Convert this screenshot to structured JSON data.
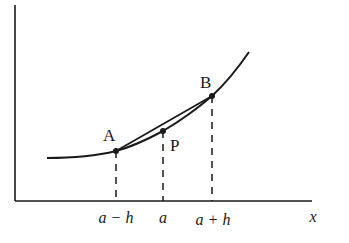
{
  "diagram": {
    "type": "central-difference-secant",
    "colors": {
      "ink": "#1a1a1a",
      "background": "#ffffff"
    },
    "axes": {
      "x_label": "x",
      "y_label": ""
    },
    "points": [
      {
        "id": "A",
        "label": "A",
        "x_tick": "a − h"
      },
      {
        "id": "P",
        "label": "P",
        "x_tick": "a"
      },
      {
        "id": "B",
        "label": "B",
        "x_tick": "a + h"
      }
    ],
    "elements": [
      "curve y = f(x)",
      "secant chord A–B",
      "dashed vertical lines from A, P, B to x-axis"
    ]
  }
}
